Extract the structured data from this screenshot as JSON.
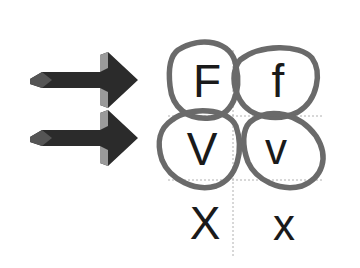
{
  "diagram": {
    "arrows": [
      {
        "id": "arrow-top",
        "points_to_row": 1,
        "color": "#2b2b2b",
        "highlight": "#9a9a9a"
      },
      {
        "id": "arrow-bottom",
        "points_to_row": 2,
        "color": "#2b2b2b",
        "highlight": "#9a9a9a"
      }
    ],
    "grid": {
      "rows": [
        {
          "left": "F",
          "right": "f",
          "circled": true
        },
        {
          "left": "V",
          "right": "v",
          "circled": true
        },
        {
          "left": "X",
          "right": "x",
          "circled": false
        }
      ]
    },
    "colors": {
      "circle_stroke": "#6a6a6a",
      "grid_line": "#b0b0b0",
      "letter": "#1a1a1a",
      "background": "#ffffff"
    }
  }
}
